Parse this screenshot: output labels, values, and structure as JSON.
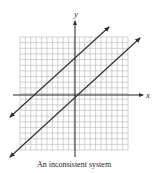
{
  "figure": {
    "caption": "An inconsistent system",
    "x_axis_label": "x",
    "y_axis_label": "y",
    "grid": {
      "columns": 20,
      "rows": 20,
      "color": "#b5b5b5"
    },
    "lines": [
      {
        "name": "upper-line",
        "description": "line with arrows at both ends, parallel to lower line",
        "color": "#333333"
      },
      {
        "name": "lower-line",
        "description": "line with arrows at both ends, parallel to upper line",
        "color": "#333333"
      }
    ],
    "relationship": "parallel lines, no intersection"
  }
}
